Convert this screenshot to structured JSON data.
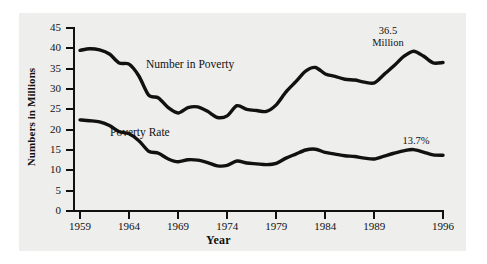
{
  "figure": {
    "background_color": "#ffffff",
    "panel_color": "#eeeeec",
    "line_color": "#111111"
  },
  "chart_data": {
    "type": "line",
    "title": "",
    "xlabel": "Year",
    "ylabel": "Numbers in Millions",
    "grid": false,
    "legend": "inline-labels",
    "xlim": [
      1959,
      1996
    ],
    "ylim": [
      0,
      45
    ],
    "ytick_labels": [
      "45",
      "40",
      "35",
      "30",
      "25",
      "20",
      "15",
      "10",
      "5",
      "0"
    ],
    "ytick_values": [
      45,
      40,
      35,
      30,
      25,
      20,
      15,
      10,
      5,
      0
    ],
    "xtick_labels": [
      "1959",
      "1964",
      "1969",
      "1974",
      "1979",
      "1984",
      "1989",
      "1996"
    ],
    "xtick_values": [
      1959,
      1964,
      1969,
      1974,
      1979,
      1984,
      1989,
      1996
    ],
    "x": [
      1959,
      1960,
      1961,
      1962,
      1963,
      1964,
      1965,
      1966,
      1967,
      1968,
      1969,
      1970,
      1971,
      1972,
      1973,
      1974,
      1975,
      1976,
      1977,
      1978,
      1979,
      1980,
      1981,
      1982,
      1983,
      1984,
      1985,
      1986,
      1987,
      1988,
      1989,
      1990,
      1991,
      1992,
      1993,
      1994,
      1995,
      1996
    ],
    "series": [
      {
        "name": "Number in Poverty",
        "label": "Number in Poverty",
        "units": "millions",
        "values": [
          39.5,
          39.9,
          39.6,
          38.6,
          36.4,
          36.1,
          33.2,
          28.5,
          27.8,
          25.4,
          24.1,
          25.4,
          25.6,
          24.5,
          23.0,
          23.4,
          25.9,
          25.0,
          24.7,
          24.5,
          26.1,
          29.3,
          31.8,
          34.4,
          35.3,
          33.7,
          33.1,
          32.4,
          32.2,
          31.7,
          31.5,
          33.6,
          35.7,
          38.0,
          39.3,
          38.1,
          36.4,
          36.5
        ]
      },
      {
        "name": "Poverty Rate",
        "label": "Poverty Rate",
        "units": "percent",
        "values": [
          22.4,
          22.2,
          21.9,
          21.0,
          19.5,
          19.0,
          17.3,
          14.7,
          14.2,
          12.8,
          12.1,
          12.6,
          12.5,
          11.9,
          11.1,
          11.2,
          12.3,
          11.8,
          11.6,
          11.4,
          11.7,
          13.0,
          14.0,
          15.0,
          15.2,
          14.4,
          14.0,
          13.6,
          13.4,
          13.0,
          12.8,
          13.5,
          14.2,
          14.8,
          15.1,
          14.5,
          13.8,
          13.7
        ]
      }
    ],
    "annotations": [
      {
        "name": "number-end-value",
        "text": "36.5",
        "text2": "Million",
        "at_year": 1996,
        "series": "Number in Poverty"
      },
      {
        "name": "rate-end-value",
        "text": "13.7%",
        "at_year": 1996,
        "series": "Poverty Rate"
      }
    ]
  }
}
